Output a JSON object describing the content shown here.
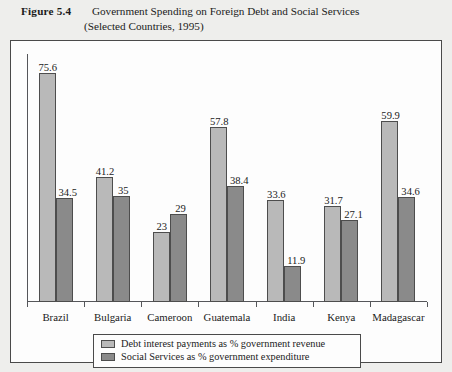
{
  "caption": {
    "figure_number": "Figure 5.4",
    "line1": "Government Spending on Foreign Debt and Social Services",
    "line2": "(Selected Countries, 1995)"
  },
  "legend": {
    "items": [
      {
        "label": "Debt interest payments as % government revenue",
        "color": "#b9b9b9"
      },
      {
        "label": "Social Services as % government expenditure",
        "color": "#8a8a8a"
      }
    ]
  },
  "chart_data": {
    "type": "bar",
    "title": "Government Spending on Foreign Debt and Social Services (Selected Countries, 1995)",
    "xlabel": "",
    "ylabel": "",
    "ylim": [
      0,
      82
    ],
    "grid": false,
    "legend_position": "bottom",
    "categories": [
      "Brazil",
      "Bulgaria",
      "Cameroon",
      "Guatemala",
      "India",
      "Kenya",
      "Madagascar"
    ],
    "series": [
      {
        "name": "Debt interest payments as % government revenue",
        "color": "#b9b9b9",
        "values": [
          75.6,
          41.2,
          23,
          57.8,
          33.6,
          31.7,
          59.9
        ],
        "labels": [
          "75.6",
          "41.2",
          "23",
          "57.8",
          "33.6",
          "31.7",
          "59.9"
        ]
      },
      {
        "name": "Social Services as % government expenditure",
        "color": "#8a8a8a",
        "values": [
          34.5,
          35,
          29,
          38.4,
          11.9,
          27.1,
          34.6
        ],
        "labels": [
          "34.5",
          "35",
          "29",
          "38.4",
          "11.9",
          "27.1",
          "34.6"
        ]
      }
    ]
  }
}
